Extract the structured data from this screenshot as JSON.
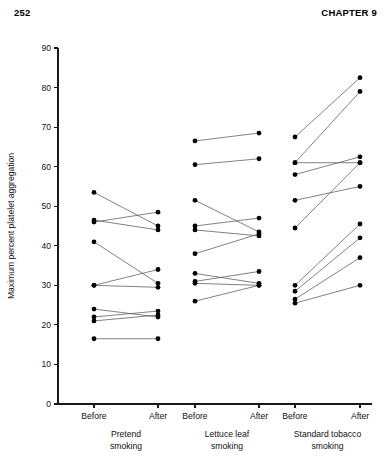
{
  "page": {
    "number": "252",
    "chapter": "CHAPTER 9"
  },
  "chart_data": {
    "type": "line",
    "title": "",
    "xlabel": "",
    "ylabel": "Maximum percent platelet aggregation",
    "ylim": [
      0,
      90
    ],
    "yticks": [
      0,
      10,
      20,
      30,
      40,
      50,
      60,
      70,
      80,
      90
    ],
    "ytick_labels": [
      "0",
      "10",
      "20",
      "30",
      "40",
      "50",
      "60",
      "70",
      "80",
      "90"
    ],
    "grid": false,
    "legend": "none",
    "x_tick_labels": [
      "Before",
      "After",
      "Before",
      "After",
      "Before",
      "After"
    ],
    "categories": [
      "Before",
      "After"
    ],
    "groups": [
      {
        "name": "Pretend smoking",
        "label_lines": [
          "Pretend",
          "smoking"
        ],
        "pairs": [
          {
            "before": 53.5,
            "after": 45.0
          },
          {
            "before": 46.5,
            "after": 44.0
          },
          {
            "before": 46.0,
            "after": 48.5
          },
          {
            "before": 41.0,
            "after": 30.5
          },
          {
            "before": 30.0,
            "after": 34.0
          },
          {
            "before": 30.0,
            "after": 29.5
          },
          {
            "before": 24.0,
            "after": 22.0
          },
          {
            "before": 22.0,
            "after": 23.5
          },
          {
            "before": 21.0,
            "after": 22.5
          },
          {
            "before": 16.5,
            "after": 16.5
          }
        ]
      },
      {
        "name": "Lettuce leaf smoking",
        "label_lines": [
          "Lettuce leaf",
          "smoking"
        ],
        "pairs": [
          {
            "before": 66.5,
            "after": 68.5
          },
          {
            "before": 60.5,
            "after": 62.0
          },
          {
            "before": 51.5,
            "after": 43.5
          },
          {
            "before": 45.0,
            "after": 47.0
          },
          {
            "before": 44.0,
            "after": 42.5
          },
          {
            "before": 38.0,
            "after": 43.0
          },
          {
            "before": 33.0,
            "after": 30.5
          },
          {
            "before": 31.0,
            "after": 33.5
          },
          {
            "before": 30.5,
            "after": 30.0
          },
          {
            "before": 26.0,
            "after": 30.0
          }
        ]
      },
      {
        "name": "Standard tobacco smoking",
        "label_lines": [
          "Standard tobacco",
          "smoking"
        ],
        "pairs": [
          {
            "before": 67.5,
            "after": 82.5
          },
          {
            "before": 61.0,
            "after": 79.0
          },
          {
            "before": 61.0,
            "after": 61.0
          },
          {
            "before": 58.0,
            "after": 62.5
          },
          {
            "before": 51.5,
            "after": 55.0
          },
          {
            "before": 44.5,
            "after": 61.0
          },
          {
            "before": 30.0,
            "after": 45.5
          },
          {
            "before": 28.5,
            "after": 42.0
          },
          {
            "before": 26.5,
            "after": 37.0
          },
          {
            "before": 25.5,
            "after": 30.0
          }
        ]
      }
    ]
  }
}
